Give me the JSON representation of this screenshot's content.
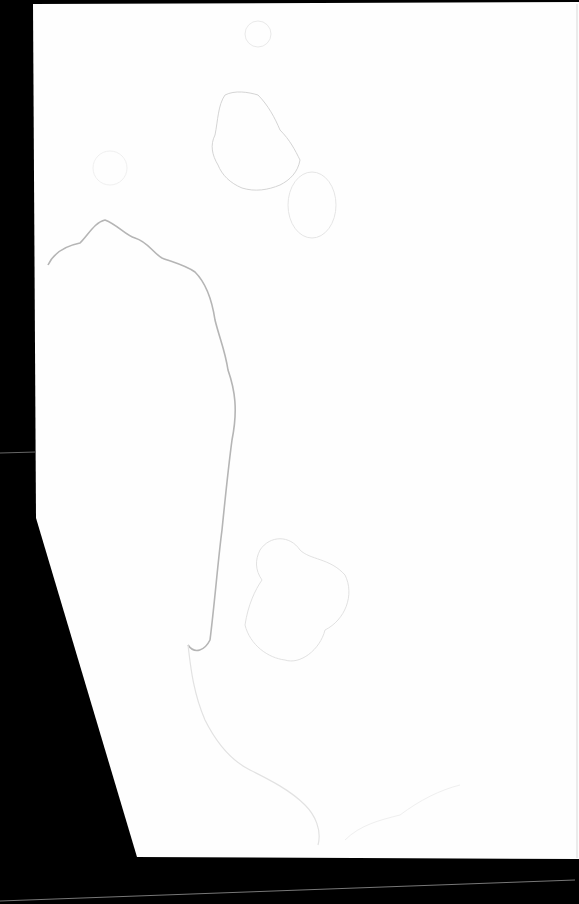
{
  "document": {
    "type": "scanned-blank-page",
    "text_content": "",
    "background_color": "#000000",
    "paper_color": "#fefefe",
    "stain_color": "#c8c8c8",
    "features": [
      "water-stain-large-left",
      "water-stain-top-center",
      "water-stain-small-circle-top",
      "water-stain-clover-center",
      "water-stain-bottom"
    ]
  }
}
